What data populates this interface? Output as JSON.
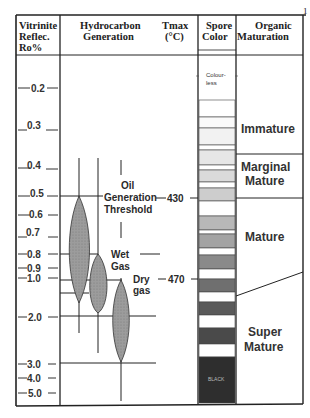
{
  "headers": {
    "vitrinite": [
      "Vitrinite",
      "Reflec.",
      "Ro%"
    ],
    "hydrocarbon": [
      "Hydrocarbon",
      "Generation"
    ],
    "tmax": [
      "Tmax",
      "(°C)"
    ],
    "spore": [
      "Spore",
      "Color"
    ],
    "organic": [
      "Organic",
      "Maturation"
    ]
  },
  "vitrinite_ticks": [
    "0.2",
    "0.3",
    "0.4",
    "0.5",
    "0.6",
    "0.7",
    "0.8",
    "0.9",
    "1.0",
    "2.0",
    "3.0",
    "4.0",
    "5.0"
  ],
  "hydrocarbon_labels": {
    "oil": [
      "Oil",
      "Generation",
      "Threshold"
    ],
    "wet_gas": [
      "Wet",
      "Gas"
    ],
    "dry_gas": [
      "Dry",
      "gas"
    ]
  },
  "tmax_values": [
    "430",
    "470"
  ],
  "spore_color_labels": {
    "top": [
      "Colour-",
      "less"
    ],
    "bottom": "BLACK"
  },
  "spore_color_bands": [
    "#ffffff",
    "#ffffff",
    "#fafafa",
    "#f2f2f2",
    "#ffffff",
    "#e8e8e8",
    "#ffffff",
    "#dcdcdc",
    "#ffffff",
    "#c8c8c8",
    "#ffffff",
    "#ababab",
    "#9a9a9a",
    "#ffffff",
    "#7a7a7a",
    "#ffffff",
    "#5a5a5a",
    "#ffffff",
    "#484848",
    "#ffffff",
    "#333333"
  ],
  "maturation_zones": [
    "Immature",
    "Marginal Mature",
    "Mature",
    "Super Mature"
  ],
  "maturation_labels": {
    "immature": "Immature",
    "marginal": [
      "Marginal",
      "Mature"
    ],
    "mature": "Mature",
    "super": [
      "Super",
      "Mature"
    ]
  },
  "page_marker": "1"
}
